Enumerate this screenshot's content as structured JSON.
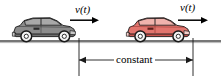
{
  "figure": {
    "width": 221,
    "height": 78,
    "background_color": "#ffffff"
  },
  "labels": {
    "velocity_left": {
      "symbol": "v",
      "arg": "(t)",
      "full": "v(t)"
    },
    "velocity_right": {
      "symbol": "v",
      "arg": "(t)",
      "full": "v(t)"
    },
    "distance": "constant"
  },
  "cars": [
    {
      "name": "grey-car",
      "body_color": "#8c8c8c",
      "body_shade": "#6e6e6e",
      "window_color": "#a9a9a9",
      "outline_color": "#1a1a1a",
      "wheel_color": "#f2f2f2",
      "wheel_rim_color": "#1a1a1a",
      "position": "left"
    },
    {
      "name": "red-car",
      "body_color": "#e2756e",
      "body_shade": "#c9524c",
      "window_color": "#f0b3ad",
      "outline_color": "#1a1a1a",
      "wheel_color": "#f2f2f2",
      "wheel_rim_color": "#1a1a1a",
      "position": "right"
    }
  ],
  "ground": {
    "name": "road-line",
    "color": "#4a4a4a",
    "y": 41
  },
  "dimension": {
    "name": "constant-distance-dimension",
    "line_color": "#1a1a1a",
    "left_x": 79,
    "right_x": 193,
    "y": 60
  },
  "arrows": {
    "color": "#000000",
    "left": {
      "x1": 70,
      "x2": 97,
      "y": 20
    },
    "right": {
      "x1": 178,
      "x2": 207,
      "y": 20
    }
  }
}
